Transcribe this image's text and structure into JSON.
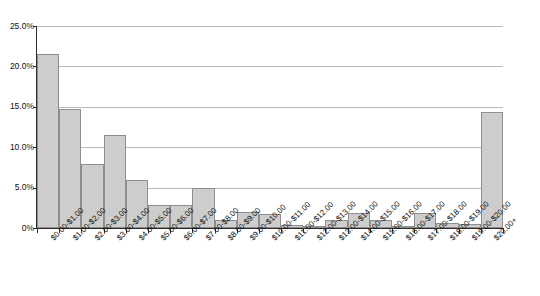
{
  "chart_data": {
    "type": "bar",
    "title": "",
    "subtitle": "",
    "xlabel": "",
    "ylabel": "",
    "ylim": [
      0,
      25
    ],
    "grid": true,
    "legend": "none",
    "y_tick_labels": [
      "25.0%",
      "20.0%",
      "15.0%",
      "10.0%",
      "5.0%",
      "0%"
    ],
    "y_tick_values": [
      25.0,
      20.0,
      15.0,
      10.0,
      5.0,
      0
    ],
    "categories": [
      "$0.00-$1.00",
      "$1.00-$2.00",
      "$2.00-$3.00",
      "$3.00-$4.00",
      "$4.00-$5.00",
      "$5.00-$6.00",
      "$6.00-$7.00",
      "$7.00-$8.00",
      "$8.00-$9.00",
      "$9.00-$10.00",
      "$10.00-$11.00",
      "$11.00-$12.00",
      "$12.00-$13.00",
      "$13.00-$14.00",
      "$14.00-$15.00",
      "$15.00-$16.00",
      "$16.00-$17.00",
      "$17.00-$18.00",
      "$18.00-$19.00",
      "$19.00-$20.00",
      "$20.00+"
    ],
    "values": [
      21.5,
      14.7,
      7.9,
      11.5,
      6.0,
      2.9,
      2.9,
      4.9,
      1.0,
      2.0,
      1.7,
      0.4,
      0.3,
      1.0,
      1.9,
      1.0,
      0.3,
      1.8,
      0.6,
      0.5,
      14.3
    ],
    "colors": {
      "bar_fill": "#cdcdcd",
      "bar_border": "#8e8e8e",
      "gridline": "#b9b9b9",
      "axis": "#2b2b2b",
      "text": "#111111",
      "background": "#ffffff"
    }
  }
}
